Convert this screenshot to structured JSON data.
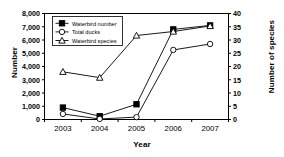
{
  "chart_data": {
    "type": "line",
    "title": "",
    "xlabel": "Year",
    "ylabel": "Number",
    "ylabel_secondary": "Number of species",
    "categories": [
      "2003",
      "2004",
      "2005",
      "2006",
      "2007"
    ],
    "x": [
      2003,
      2004,
      2005,
      2006,
      2007
    ],
    "ylim": [
      0,
      8000
    ],
    "ylim_secondary": [
      0,
      40
    ],
    "yticks": [
      "0",
      "1,000",
      "2,000",
      "3,000",
      "4,000",
      "5,000",
      "6,000",
      "7,000",
      "8,000"
    ],
    "ytick_values": [
      0,
      1000,
      2000,
      3000,
      4000,
      5000,
      6000,
      7000,
      8000
    ],
    "yticks_secondary": [
      "0",
      "5",
      "10",
      "15",
      "20",
      "25",
      "30",
      "35",
      "40"
    ],
    "ytick_values_secondary": [
      0,
      5,
      10,
      15,
      20,
      25,
      30,
      35,
      40
    ],
    "xtick_labels": [
      "2003",
      "2004",
      "2005",
      "2006",
      "2007"
    ],
    "grid": false,
    "legend_position": "top-left",
    "series": [
      {
        "name": "Waterbird number",
        "axis": "left",
        "marker": "filled-square",
        "color": "#000000",
        "values": [
          900,
          250,
          1150,
          6800,
          7100
        ]
      },
      {
        "name": "Total ducks",
        "axis": "left",
        "marker": "open-circle",
        "color": "#000000",
        "values": [
          420,
          40,
          180,
          5250,
          5700
        ]
      },
      {
        "name": "Waterbird species",
        "axis": "right",
        "marker": "open-triangle",
        "color": "#000000",
        "values": [
          18,
          15.8,
          31.7,
          33.2,
          35.3
        ]
      }
    ]
  }
}
